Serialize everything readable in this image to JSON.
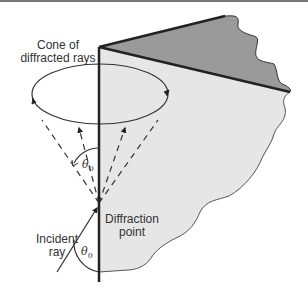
{
  "figure": {
    "type": "diagram",
    "labels": {
      "cone": [
        "Cone of",
        "diffracted rays"
      ],
      "diffraction_point": [
        "Diffraction",
        "point"
      ],
      "incident_ray": [
        "Incident",
        "ray"
      ]
    },
    "angle_symbol": "θ",
    "angle_subscript": "0",
    "colors": {
      "front_face": "#e8e8e8",
      "top_face": "#999999",
      "edge_line": "#222222",
      "stroke": "#333333",
      "background": "#ffffff"
    }
  }
}
